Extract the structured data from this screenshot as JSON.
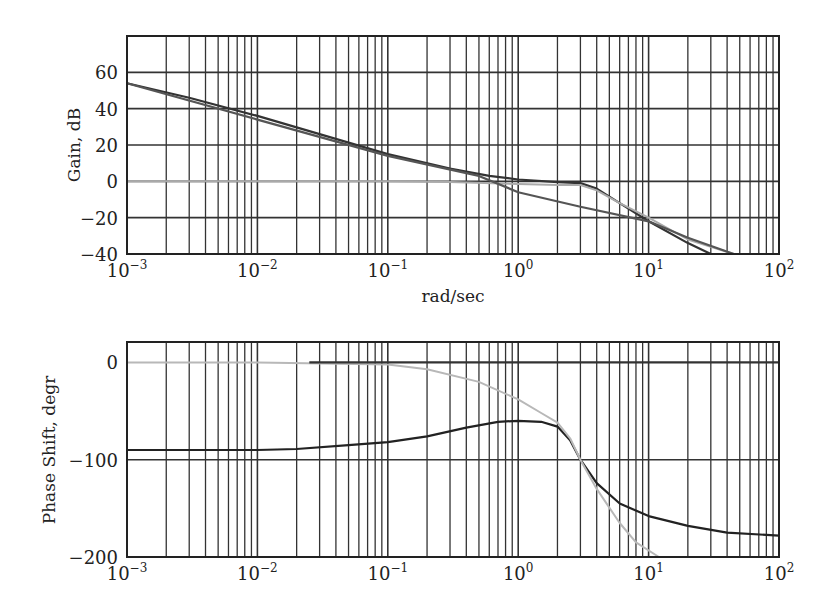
{
  "chart_data": [
    {
      "type": "line",
      "title": "",
      "xlabel": "rad/sec",
      "ylabel": "Gain, dB",
      "xscale": "log",
      "xlim": [
        0.001,
        100
      ],
      "ylim": [
        -40,
        80
      ],
      "xticks": [
        "10^-3",
        "10^-2",
        "10^-1",
        "10^0",
        "10^1",
        "10^2"
      ],
      "yticks": [
        60,
        40,
        20,
        0,
        -20,
        -40
      ],
      "grid": true,
      "legend": null,
      "series": [
        {
          "name": "open-loop gain",
          "color": "#333333",
          "x": [
            0.001,
            0.003,
            0.01,
            0.03,
            0.1,
            0.3,
            0.6,
            1.0,
            2.0,
            3.0,
            4.0,
            6.0,
            10,
            20,
            30
          ],
          "y": [
            54,
            46,
            36,
            26,
            15,
            7,
            3,
            1,
            -0.5,
            -1,
            -4,
            -12,
            -22,
            -34,
            -40
          ]
        },
        {
          "name": "closed-loop gain",
          "color": "#aaaaaa",
          "x": [
            0.001,
            0.01,
            0.1,
            0.3,
            1.0,
            2.0,
            3.0,
            4.0,
            6.0,
            10,
            20,
            45
          ],
          "y": [
            0,
            0,
            0,
            -0.3,
            -1.5,
            -2,
            -2,
            -5,
            -12,
            -20,
            -32,
            -40
          ]
        },
        {
          "name": "asymptote",
          "color": "#555555",
          "x": [
            0.001,
            0.01,
            0.1,
            0.5,
            1.0,
            3.0,
            10,
            20,
            45
          ],
          "y": [
            54,
            34,
            14,
            3,
            -6,
            -14,
            -22,
            -31,
            -40
          ]
        }
      ]
    },
    {
      "type": "line",
      "title": "",
      "xlabel": "",
      "ylabel": "Phase Shift, degr",
      "xscale": "log",
      "xlim": [
        0.001,
        100
      ],
      "ylim": [
        -200,
        21
      ],
      "xticks": [
        "10^-3",
        "10^-2",
        "10^-1",
        "10^0",
        "10^1",
        "10^2"
      ],
      "yticks": [
        0,
        -100,
        -200
      ],
      "grid": true,
      "legend": null,
      "series": [
        {
          "name": "open-loop phase",
          "color": "#222222",
          "x": [
            0.001,
            0.01,
            0.02,
            0.05,
            0.1,
            0.2,
            0.4,
            0.7,
            1.0,
            1.5,
            2.0,
            2.5,
            3.0,
            4.0,
            6.0,
            10,
            20,
            40,
            100
          ],
          "y": [
            -90,
            -90,
            -89,
            -85,
            -82,
            -76,
            -67,
            -61,
            -60,
            -61,
            -66,
            -80,
            -100,
            -124,
            -145,
            -158,
            -168,
            -175,
            -178
          ]
        },
        {
          "name": "closed-loop phase",
          "color": "#b8b8b8",
          "x": [
            0.001,
            0.01,
            0.1,
            0.2,
            0.5,
            1.0,
            1.5,
            2.0,
            2.5,
            3.0,
            4.0,
            6.0,
            8.0,
            12
          ],
          "y": [
            0,
            0,
            -2,
            -7,
            -20,
            -38,
            -52,
            -62,
            -78,
            -100,
            -130,
            -165,
            -185,
            -200
          ]
        },
        {
          "name": "reference 0 deg",
          "color": "#333333",
          "x": [
            0.025,
            100
          ],
          "y": [
            0,
            0
          ]
        }
      ]
    }
  ],
  "labels": {
    "gain_ylabel": "Gain, dB",
    "phase_ylabel": "Phase Shift, degr",
    "xlabel": "rad/sec",
    "gain_yticks": [
      "60",
      "40",
      "20",
      "0",
      "−20",
      "−40"
    ],
    "phase_yticks": [
      "0",
      "−100",
      "−200"
    ],
    "xtick_base": "10",
    "xtick_exps": [
      "−3",
      "−2",
      "−1",
      "0",
      "1",
      "2"
    ]
  }
}
